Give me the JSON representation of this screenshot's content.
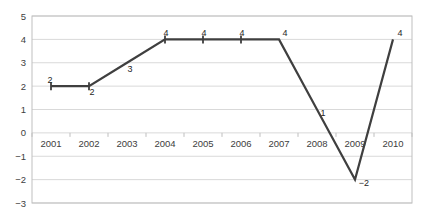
{
  "chart_data": {
    "type": "line",
    "title": "",
    "xlabel": "",
    "ylabel": "",
    "categories": [
      "2001",
      "2002",
      "2003",
      "2004",
      "2005",
      "2006",
      "2007",
      "2008",
      "2009",
      "2010"
    ],
    "values": [
      2,
      2,
      3,
      4,
      4,
      4,
      4,
      1,
      -2,
      4
    ],
    "point_labels": [
      "2",
      "2",
      "3",
      "4",
      "4",
      "4",
      "4",
      "1",
      "-2",
      "4"
    ],
    "ylim": [
      -3,
      5
    ],
    "ytick_labels": [
      "5",
      "4",
      "3",
      "2",
      "1",
      "0",
      "-1",
      "-2",
      "-3"
    ],
    "yticks": [
      5,
      4,
      3,
      2,
      1,
      0,
      -1,
      -2,
      -3
    ],
    "grid": true,
    "legend": false,
    "series": [
      {
        "name": "Series 1",
        "values": [
          2,
          2,
          3,
          4,
          4,
          4,
          4,
          1,
          -2,
          4
        ],
        "color": "#3f3f3f",
        "marker": "cross"
      }
    ],
    "colors": {
      "line": "#3f3f3f",
      "grid": "#d9d9d9",
      "axis": "#bfbfbf",
      "text": "#404040",
      "label": "#262626",
      "background": "#ffffff"
    }
  }
}
